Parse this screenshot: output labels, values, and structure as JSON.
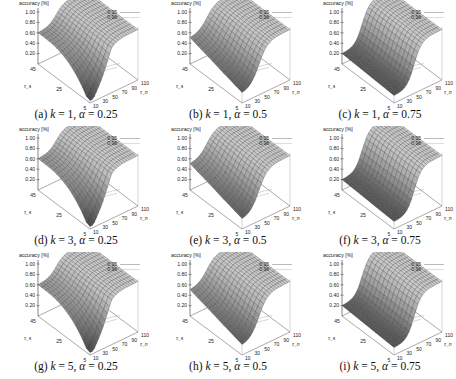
{
  "figure": {
    "panels": [
      {
        "id": "a",
        "label": "(a)",
        "k": "1",
        "alpha": "0.25",
        "caption_math": "k = 1, α = 0.25"
      },
      {
        "id": "b",
        "label": "(b)",
        "k": "1",
        "alpha": "0.5",
        "caption_math": "k = 1, α = 0.5"
      },
      {
        "id": "c",
        "label": "(c)",
        "k": "1",
        "alpha": "0.75",
        "caption_math": "k = 1, α = 0.75"
      },
      {
        "id": "d",
        "label": "(d)",
        "k": "3",
        "alpha": "0.25",
        "caption_math": "k = 3, α = 0.25"
      },
      {
        "id": "e",
        "label": "(e)",
        "k": "3",
        "alpha": "0.5",
        "caption_math": "k = 3, α = 0.5"
      },
      {
        "id": "f",
        "label": "(f)",
        "k": "3",
        "alpha": "0.75",
        "caption_math": "k = 3, α = 0.75"
      },
      {
        "id": "g",
        "label": "(g)",
        "k": "5",
        "alpha": "0.25",
        "caption_math": "k = 5, α = 0.25"
      },
      {
        "id": "h",
        "label": "(h)",
        "k": "5",
        "alpha": "0.5",
        "caption_math": "k = 5, α = 0.5"
      },
      {
        "id": "i",
        "label": "(i)",
        "k": "5",
        "alpha": "0.75",
        "caption_math": "k = 5, α = 0.75"
      }
    ]
  },
  "axes": {
    "zlabel": "accuracy [%]",
    "ztick_labels": [
      "1.00",
      "0.80",
      "0.60",
      "0.40",
      "0.20"
    ],
    "xlabel": "τ_s",
    "xtick_labels": [
      "45",
      "25",
      "5"
    ],
    "ylabel": "τ_n",
    "ytick_labels": [
      "10",
      "30",
      "50",
      "70",
      "90",
      "110"
    ],
    "legend": [
      "0.95",
      "0.96"
    ]
  },
  "chart_data": {
    "type": "surface3d",
    "title": "",
    "zlabel": "accuracy [%]",
    "xlabel": "τ_s",
    "ylabel": "τ_n",
    "zlim": [
      0,
      1.0
    ],
    "xrange": [
      5,
      45
    ],
    "yrange": [
      10,
      110
    ],
    "legend_entries": [
      "0.95 (contour)",
      "0.96 (contour)"
    ],
    "grid": true,
    "panels": [
      {
        "label": "(a) k=1, α=0.25",
        "surface_low_corner_accuracy": 0.05,
        "plateau_accuracy": 0.97,
        "far_edge_accuracy_at_tau_n_10": 0.6,
        "shape": "sharp dip near τ_s=5, τ_n=10; plateau ~0.97 for τ_n>~50"
      },
      {
        "label": "(b) k=1, α=0.5",
        "surface_low_corner_accuracy": 0.15,
        "plateau_accuracy": 0.97,
        "far_edge_accuracy_at_tau_n_10": 0.45,
        "shape": "gradual rise along τ_n, darker low region"
      },
      {
        "label": "(c) k=1, α=0.75",
        "surface_low_corner_accuracy": 0.15,
        "plateau_accuracy": 0.97,
        "far_edge_accuracy_at_tau_n_10": 0.2,
        "shape": "low along τ_n<40 for all τ_s; steep rise to plateau"
      },
      {
        "label": "(d) k=3, α=0.25",
        "surface_low_corner_accuracy": 0.05,
        "plateau_accuracy": 0.97,
        "far_edge_accuracy_at_tau_n_10": 0.6,
        "shape": "sharp dip near τ_s=5, τ_n=10"
      },
      {
        "label": "(e) k=3, α=0.5",
        "surface_low_corner_accuracy": 0.15,
        "plateau_accuracy": 0.97,
        "far_edge_accuracy_at_tau_n_10": 0.45,
        "shape": "gradual rise along τ_n"
      },
      {
        "label": "(f) k=3, α=0.75",
        "surface_low_corner_accuracy": 0.15,
        "plateau_accuracy": 0.97,
        "far_edge_accuracy_at_tau_n_10": 0.2,
        "shape": "low along τ_n<40; steep rise"
      },
      {
        "label": "(g) k=5, α=0.25",
        "surface_low_corner_accuracy": 0.05,
        "plateau_accuracy": 0.97,
        "far_edge_accuracy_at_tau_n_10": 0.6,
        "shape": "sharp dip near τ_s=5, τ_n=10"
      },
      {
        "label": "(h) k=5, α=0.5",
        "surface_low_corner_accuracy": 0.15,
        "plateau_accuracy": 0.97,
        "far_edge_accuracy_at_tau_n_10": 0.45,
        "shape": "gradual rise along τ_n"
      },
      {
        "label": "(i) k=5, α=0.75",
        "surface_low_corner_accuracy": 0.15,
        "plateau_accuracy": 0.97,
        "far_edge_accuracy_at_tau_n_10": 0.2,
        "shape": "low along τ_n<40; steep rise"
      }
    ]
  }
}
